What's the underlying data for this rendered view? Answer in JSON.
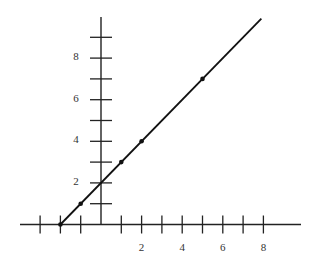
{
  "chart_data": {
    "type": "line",
    "title": "",
    "xlabel": "",
    "ylabel": "",
    "xlim": [
      -4,
      9.8
    ],
    "ylim": [
      0,
      10.2
    ],
    "grid": false,
    "legend": null,
    "x_ticks": [
      -3,
      -2,
      -1,
      0,
      1,
      2,
      3,
      4,
      5,
      6,
      7,
      8
    ],
    "x_tick_labels": [
      "2",
      "4",
      "6",
      "8"
    ],
    "x_tick_label_values": [
      2,
      4,
      6,
      8
    ],
    "y_ticks": [
      1,
      2,
      3,
      4,
      5,
      6,
      7,
      8,
      9
    ],
    "y_tick_labels": [
      "2",
      "4",
      "6",
      "8"
    ],
    "y_tick_label_values": [
      2,
      4,
      6,
      8
    ],
    "series": [
      {
        "name": "y = x + 2",
        "type": "line",
        "x": [
          -2,
          7.9
        ],
        "y": [
          0,
          9.9
        ]
      },
      {
        "name": "points",
        "type": "scatter",
        "x": [
          -2,
          -1,
          1,
          2,
          5
        ],
        "y": [
          0,
          1,
          3,
          4,
          7
        ]
      }
    ]
  },
  "colors": {
    "axis": "#222222",
    "line": "#111111",
    "label": "#333333"
  }
}
